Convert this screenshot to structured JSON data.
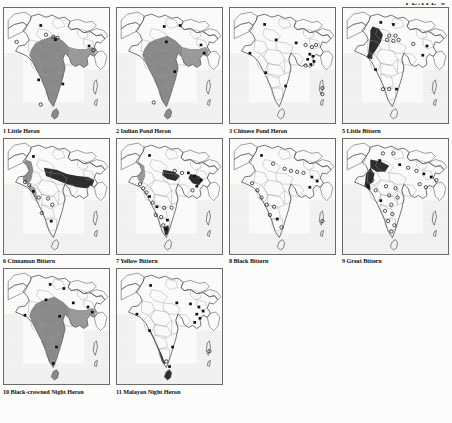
{
  "plate": {
    "header": "PLATE 6"
  },
  "style_tokens": {
    "range_shade_heavy": "#8a8a8a",
    "range_shade_dark": "#2e2e2e",
    "coastline": "#5a5a5a",
    "internal_border": "#9a9a9a",
    "sea": "#f2f2f0",
    "land": "#fbfbfa",
    "frame": "#6b6b6b",
    "text": "#111111"
  },
  "legend_symbols": [
    {
      "name": "filled-square",
      "meaning": "confirmed record"
    },
    {
      "name": "open-circle",
      "meaning": "unconfirmed / old record"
    },
    {
      "name": "range-shading",
      "meaning": "breeding / resident range"
    }
  ],
  "maps": [
    {
      "number": "1",
      "name": "Little Heron",
      "caption": "1   Little Heron",
      "shading": "heavy",
      "range_note": "most of peninsular India and eastern seaboard shaded",
      "points": [
        {
          "x": 12,
          "y": 33,
          "type": "open-circle"
        },
        {
          "x": 35,
          "y": 17,
          "type": "filled-square"
        },
        {
          "x": 40,
          "y": 26,
          "type": "open-circle"
        },
        {
          "x": 47,
          "y": 28,
          "type": "open-circle"
        },
        {
          "x": 51,
          "y": 29,
          "type": "open-circle"
        },
        {
          "x": 49,
          "y": 31,
          "type": "filled-square"
        },
        {
          "x": 81,
          "y": 37,
          "type": "filled-square"
        },
        {
          "x": 85,
          "y": 41,
          "type": "open-circle"
        },
        {
          "x": 33,
          "y": 70,
          "type": "filled-square"
        },
        {
          "x": 56,
          "y": 74,
          "type": "filled-square"
        },
        {
          "x": 35,
          "y": 94,
          "type": "open-circle"
        }
      ]
    },
    {
      "number": "2",
      "name": "Indian Pond Heron",
      "caption": "2   Indian Pond Heron",
      "shading": "heavy",
      "range_note": "almost entire subcontinent shaded except Thar desert and high Himalaya",
      "points": [
        {
          "x": 45,
          "y": 18,
          "type": "filled-square"
        },
        {
          "x": 60,
          "y": 17,
          "type": "filled-square"
        },
        {
          "x": 47,
          "y": 33,
          "type": "filled-square"
        },
        {
          "x": 80,
          "y": 36,
          "type": "filled-square"
        },
        {
          "x": 83,
          "y": 44,
          "type": "filled-square"
        },
        {
          "x": 55,
          "y": 62,
          "type": "filled-square"
        },
        {
          "x": 35,
          "y": 92,
          "type": "open-circle"
        }
      ]
    },
    {
      "number": "3",
      "name": "Chinese Pond Heron",
      "caption": "3   Chinese Pond Heron",
      "shading": "none",
      "range_note": "no range shading; scattered point records concentrated in the north-east",
      "points": [
        {
          "x": 33,
          "y": 16,
          "type": "filled-square"
        },
        {
          "x": 44,
          "y": 31,
          "type": "filled-square"
        },
        {
          "x": 19,
          "y": 44,
          "type": "filled-square"
        },
        {
          "x": 63,
          "y": 34,
          "type": "filled-square"
        },
        {
          "x": 72,
          "y": 36,
          "type": "open-circle"
        },
        {
          "x": 78,
          "y": 38,
          "type": "open-circle"
        },
        {
          "x": 82,
          "y": 36,
          "type": "open-circle"
        },
        {
          "x": 76,
          "y": 45,
          "type": "filled-square"
        },
        {
          "x": 79,
          "y": 47,
          "type": "filled-square"
        },
        {
          "x": 74,
          "y": 50,
          "type": "filled-square"
        },
        {
          "x": 80,
          "y": 52,
          "type": "filled-square"
        },
        {
          "x": 72,
          "y": 56,
          "type": "open-circle"
        },
        {
          "x": 77,
          "y": 55,
          "type": "filled-square"
        },
        {
          "x": 34,
          "y": 63,
          "type": "filled-square"
        },
        {
          "x": 53,
          "y": 76,
          "type": "filled-square"
        },
        {
          "x": 88,
          "y": 78,
          "type": "open-circle"
        },
        {
          "x": 88,
          "y": 84,
          "type": "open-circle"
        }
      ]
    },
    {
      "number": "5",
      "name": "Little Bittern",
      "caption": "5   Little Bittern",
      "shading": "dark-band",
      "range_note": "dark band through Indus valley and north-west; scattered records elsewhere",
      "points": [
        {
          "x": 36,
          "y": 14,
          "type": "filled-square"
        },
        {
          "x": 48,
          "y": 16,
          "type": "filled-square"
        },
        {
          "x": 44,
          "y": 27,
          "type": "open-circle"
        },
        {
          "x": 50,
          "y": 27,
          "type": "open-circle"
        },
        {
          "x": 42,
          "y": 31,
          "type": "open-circle"
        },
        {
          "x": 48,
          "y": 32,
          "type": "open-circle"
        },
        {
          "x": 53,
          "y": 31,
          "type": "open-circle"
        },
        {
          "x": 67,
          "y": 35,
          "type": "open-circle"
        },
        {
          "x": 80,
          "y": 37,
          "type": "filled-square"
        },
        {
          "x": 76,
          "y": 46,
          "type": "filled-square"
        },
        {
          "x": 31,
          "y": 60,
          "type": "filled-square"
        },
        {
          "x": 38,
          "y": 79,
          "type": "open-circle"
        },
        {
          "x": 44,
          "y": 79,
          "type": "open-circle"
        },
        {
          "x": 51,
          "y": 79,
          "type": "filled-square"
        }
      ]
    },
    {
      "number": "6",
      "name": "Cinnamon Bittern",
      "caption": "6   Cinnamon Bittern",
      "shading": "dark-plain",
      "range_note": "dark shading across Gangetic plain and north-east; grey strip on Western Ghats",
      "points": [
        {
          "x": 28,
          "y": 17,
          "type": "filled-square"
        },
        {
          "x": 20,
          "y": 42,
          "type": "open-circle"
        },
        {
          "x": 24,
          "y": 45,
          "type": "open-circle"
        },
        {
          "x": 28,
          "y": 51,
          "type": "filled-square"
        },
        {
          "x": 33,
          "y": 57,
          "type": "open-circle"
        },
        {
          "x": 42,
          "y": 58,
          "type": "open-circle"
        },
        {
          "x": 46,
          "y": 64,
          "type": "open-circle"
        },
        {
          "x": 36,
          "y": 72,
          "type": "open-circle"
        },
        {
          "x": 45,
          "y": 80,
          "type": "filled-square"
        }
      ]
    },
    {
      "number": "7",
      "name": "Yellow Bittern",
      "caption": "7   Yellow Bittern",
      "shading": "patchy-dark",
      "range_note": "dark patches central-north and north-east; many point records down the west coast",
      "points": [
        {
          "x": 31,
          "y": 16,
          "type": "filled-square"
        },
        {
          "x": 55,
          "y": 31,
          "type": "open-circle"
        },
        {
          "x": 62,
          "y": 33,
          "type": "open-circle"
        },
        {
          "x": 68,
          "y": 33,
          "type": "filled-square"
        },
        {
          "x": 74,
          "y": 36,
          "type": "filled-square"
        },
        {
          "x": 80,
          "y": 40,
          "type": "filled-square"
        },
        {
          "x": 76,
          "y": 46,
          "type": "filled-square"
        },
        {
          "x": 72,
          "y": 50,
          "type": "open-circle"
        },
        {
          "x": 22,
          "y": 44,
          "type": "open-circle"
        },
        {
          "x": 25,
          "y": 48,
          "type": "open-circle"
        },
        {
          "x": 28,
          "y": 52,
          "type": "open-circle"
        },
        {
          "x": 31,
          "y": 56,
          "type": "filled-square"
        },
        {
          "x": 34,
          "y": 62,
          "type": "open-circle"
        },
        {
          "x": 38,
          "y": 66,
          "type": "filled-square"
        },
        {
          "x": 45,
          "y": 67,
          "type": "open-circle"
        },
        {
          "x": 52,
          "y": 67,
          "type": "open-circle"
        },
        {
          "x": 37,
          "y": 74,
          "type": "open-circle"
        },
        {
          "x": 42,
          "y": 76,
          "type": "open-circle"
        },
        {
          "x": 48,
          "y": 79,
          "type": "filled-square"
        },
        {
          "x": 44,
          "y": 84,
          "type": "open-circle"
        },
        {
          "x": 47,
          "y": 88,
          "type": "filled-square"
        }
      ]
    },
    {
      "number": "8",
      "name": "Black Bittern",
      "caption": "8   Black Bittern",
      "shading": "light",
      "range_note": "light/absent shading; records along west coast, north-east and Sri Lanka",
      "points": [
        {
          "x": 30,
          "y": 16,
          "type": "filled-square"
        },
        {
          "x": 41,
          "y": 24,
          "type": "open-circle"
        },
        {
          "x": 52,
          "y": 29,
          "type": "open-circle"
        },
        {
          "x": 58,
          "y": 31,
          "type": "open-circle"
        },
        {
          "x": 64,
          "y": 32,
          "type": "open-circle"
        },
        {
          "x": 70,
          "y": 33,
          "type": "open-circle"
        },
        {
          "x": 78,
          "y": 37,
          "type": "filled-square"
        },
        {
          "x": 83,
          "y": 41,
          "type": "filled-square"
        },
        {
          "x": 76,
          "y": 47,
          "type": "filled-square"
        },
        {
          "x": 21,
          "y": 43,
          "type": "open-circle"
        },
        {
          "x": 26,
          "y": 50,
          "type": "open-circle"
        },
        {
          "x": 30,
          "y": 57,
          "type": "open-circle"
        },
        {
          "x": 35,
          "y": 64,
          "type": "open-circle"
        },
        {
          "x": 42,
          "y": 66,
          "type": "open-circle"
        },
        {
          "x": 38,
          "y": 74,
          "type": "open-circle"
        },
        {
          "x": 45,
          "y": 78,
          "type": "filled-square"
        },
        {
          "x": 49,
          "y": 86,
          "type": "open-circle"
        },
        {
          "x": 88,
          "y": 80,
          "type": "open-circle"
        }
      ]
    },
    {
      "number": "9",
      "name": "Great Bittern",
      "caption": "9   Great Bittern",
      "shading": "dark-nw",
      "range_note": "dark wedge in north-west; numerous open-circle winter records across the plains",
      "points": [
        {
          "x": 38,
          "y": 14,
          "type": "open-circle"
        },
        {
          "x": 48,
          "y": 14,
          "type": "open-circle"
        },
        {
          "x": 35,
          "y": 21,
          "type": "filled-square"
        },
        {
          "x": 54,
          "y": 25,
          "type": "filled-square"
        },
        {
          "x": 62,
          "y": 28,
          "type": "open-circle"
        },
        {
          "x": 70,
          "y": 31,
          "type": "open-circle"
        },
        {
          "x": 77,
          "y": 34,
          "type": "filled-square"
        },
        {
          "x": 84,
          "y": 37,
          "type": "filled-square"
        },
        {
          "x": 89,
          "y": 40,
          "type": "open-circle"
        },
        {
          "x": 73,
          "y": 44,
          "type": "open-circle"
        },
        {
          "x": 79,
          "y": 47,
          "type": "open-circle"
        },
        {
          "x": 28,
          "y": 40,
          "type": "open-circle"
        },
        {
          "x": 24,
          "y": 46,
          "type": "filled-square"
        },
        {
          "x": 31,
          "y": 50,
          "type": "open-circle"
        },
        {
          "x": 41,
          "y": 46,
          "type": "open-circle"
        },
        {
          "x": 50,
          "y": 48,
          "type": "open-circle"
        },
        {
          "x": 44,
          "y": 55,
          "type": "open-circle"
        },
        {
          "x": 52,
          "y": 57,
          "type": "open-circle"
        },
        {
          "x": 36,
          "y": 60,
          "type": "filled-square"
        },
        {
          "x": 46,
          "y": 64,
          "type": "open-circle"
        },
        {
          "x": 40,
          "y": 70,
          "type": "open-circle"
        },
        {
          "x": 47,
          "y": 73,
          "type": "open-circle"
        },
        {
          "x": 43,
          "y": 80,
          "type": "open-circle"
        },
        {
          "x": 49,
          "y": 84,
          "type": "open-circle"
        },
        {
          "x": 46,
          "y": 90,
          "type": "open-circle"
        }
      ]
    },
    {
      "number": "10",
      "name": "Black-crowned Night Heron",
      "caption": "10 Black-crowned Night Heron",
      "shading": "heavy",
      "range_note": "widespread heavy shading over nearly the whole subcontinent",
      "points": [
        {
          "x": 44,
          "y": 15,
          "type": "filled-square"
        },
        {
          "x": 57,
          "y": 19,
          "type": "filled-square"
        },
        {
          "x": 40,
          "y": 30,
          "type": "filled-square"
        },
        {
          "x": 66,
          "y": 33,
          "type": "filled-square"
        },
        {
          "x": 80,
          "y": 37,
          "type": "filled-square"
        },
        {
          "x": 84,
          "y": 42,
          "type": "filled-square"
        },
        {
          "x": 53,
          "y": 46,
          "type": "filled-square"
        },
        {
          "x": 20,
          "y": 45,
          "type": "filled-square"
        },
        {
          "x": 50,
          "y": 76,
          "type": "filled-square"
        },
        {
          "x": 47,
          "y": 92,
          "type": "filled-square"
        }
      ]
    },
    {
      "number": "11",
      "name": "Malayan Night Heron",
      "caption": "11 Malayan Night Heron",
      "shading": "strip",
      "range_note": "narrow dark strip along south-west coast / Western Ghats and Sri Lanka",
      "points": [
        {
          "x": 32,
          "y": 16,
          "type": "filled-square"
        },
        {
          "x": 57,
          "y": 33,
          "type": "filled-square"
        },
        {
          "x": 70,
          "y": 34,
          "type": "filled-square"
        },
        {
          "x": 78,
          "y": 37,
          "type": "filled-square"
        },
        {
          "x": 82,
          "y": 41,
          "type": "filled-square"
        },
        {
          "x": 76,
          "y": 44,
          "type": "filled-square"
        },
        {
          "x": 79,
          "y": 48,
          "type": "filled-square"
        },
        {
          "x": 74,
          "y": 52,
          "type": "filled-square"
        },
        {
          "x": 19,
          "y": 44,
          "type": "filled-square"
        },
        {
          "x": 31,
          "y": 60,
          "type": "filled-square"
        },
        {
          "x": 53,
          "y": 76,
          "type": "filled-square"
        },
        {
          "x": 47,
          "y": 90,
          "type": "open-circle"
        },
        {
          "x": 50,
          "y": 95,
          "type": "filled-square"
        },
        {
          "x": 88,
          "y": 80,
          "type": "open-circle"
        }
      ]
    }
  ]
}
